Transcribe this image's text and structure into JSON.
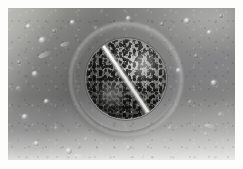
{
  "image": {
    "kind": "micrograph",
    "modality": "phase-contrast / electron micrograph",
    "subject": "dividing coccoid bacterial cell",
    "alt_text": "Grayscale micrograph of a round bacterial cell undergoing binary fission, showing a bright diagonal septum dividing the granular cytoplasm into two daughter cells, surrounded by a bright halo on a mottled gray background",
    "caption": "",
    "orientation": "landscape",
    "border": {
      "style": "white photographic border",
      "color": "#fdfdfc",
      "thickness_px": 8
    },
    "frame": {
      "width_px": 243,
      "height_px": 169
    },
    "plate": {
      "width_px": 227,
      "height_px": 152
    }
  },
  "palette": {
    "border_white": "#fdfdfc",
    "background_light": "#b4b4b2",
    "background_mid": "#8a8a87",
    "background_dark": "#565654",
    "halo_bright": "#f8f8f4",
    "cell_wall": "#ededE8",
    "cytoplasm_dark": "#3c3c3a",
    "granule_black": "#121211",
    "septum_white": "#fafaf6"
  },
  "cell": {
    "label": "dividing bacterial cell",
    "shape": "coccus",
    "center_px": {
      "x": 118,
      "y": 71
    },
    "diameter_px": 96,
    "features": [
      {
        "name": "outer-halo",
        "label": "phase-contrast halo"
      },
      {
        "name": "cell-wall",
        "label": "bright cell wall ring"
      },
      {
        "name": "cell-membrane",
        "label": "inner envelope"
      },
      {
        "name": "cytoplasm",
        "label": "granular cytoplasm"
      },
      {
        "name": "septum",
        "label": "division septum"
      },
      {
        "name": "nucleoid-upper",
        "label": "upper daughter nucleoid"
      },
      {
        "name": "nucleoid-lower",
        "label": "lower daughter nucleoid"
      }
    ],
    "septum": {
      "label": "division septum",
      "orientation": "diagonal, upper-left to lower-right",
      "angle_deg": 56
    },
    "daughter_cells": [
      {
        "name": "daughter-cell-upper-right",
        "label": "upper-right daughter cell"
      },
      {
        "name": "daughter-cell-lower-left",
        "label": "lower-left daughter cell"
      }
    ]
  },
  "background": {
    "label": "substrate field",
    "texture": "mottled film grain with uneven illumination",
    "particles": [
      {
        "id": 1,
        "x": 18,
        "y": 16,
        "size": 5,
        "tone": "bright"
      },
      {
        "id": 2,
        "x": 31,
        "y": 29,
        "size": 7,
        "tone": "bright"
      },
      {
        "id": 3,
        "x": 44,
        "y": 21,
        "size": 4,
        "tone": "dark"
      },
      {
        "id": 4,
        "x": 62,
        "y": 12,
        "size": 5,
        "tone": "bright"
      },
      {
        "id": 5,
        "x": 86,
        "y": 18,
        "size": 4,
        "tone": "faint"
      },
      {
        "id": 6,
        "x": 118,
        "y": 8,
        "size": 5,
        "tone": "bright"
      },
      {
        "id": 7,
        "x": 152,
        "y": 14,
        "size": 4,
        "tone": "dark"
      },
      {
        "id": 8,
        "x": 176,
        "y": 10,
        "size": 6,
        "tone": "bright"
      },
      {
        "id": 9,
        "x": 199,
        "y": 22,
        "size": 5,
        "tone": "bright"
      },
      {
        "id": 10,
        "x": 211,
        "y": 6,
        "size": 4,
        "tone": "dark"
      },
      {
        "id": 11,
        "x": 9,
        "y": 52,
        "size": 4,
        "tone": "dark"
      },
      {
        "id": 12,
        "x": 24,
        "y": 63,
        "size": 6,
        "tone": "bright"
      },
      {
        "id": 13,
        "x": 8,
        "y": 78,
        "size": 5,
        "tone": "faint"
      },
      {
        "id": 14,
        "x": 36,
        "y": 91,
        "size": 5,
        "tone": "bright"
      },
      {
        "id": 15,
        "x": 14,
        "y": 106,
        "size": 6,
        "tone": "bright"
      },
      {
        "id": 16,
        "x": 46,
        "y": 118,
        "size": 4,
        "tone": "faint"
      },
      {
        "id": 17,
        "x": 26,
        "y": 133,
        "size": 5,
        "tone": "bright"
      },
      {
        "id": 18,
        "x": 58,
        "y": 140,
        "size": 6,
        "tone": "bright"
      },
      {
        "id": 19,
        "x": 76,
        "y": 129,
        "size": 4,
        "tone": "faint"
      },
      {
        "id": 20,
        "x": 118,
        "y": 137,
        "size": 5,
        "tone": "faint"
      },
      {
        "id": 21,
        "x": 168,
        "y": 60,
        "size": 5,
        "tone": "bright"
      },
      {
        "id": 22,
        "x": 186,
        "y": 46,
        "size": 4,
        "tone": "dark"
      },
      {
        "id": 23,
        "x": 203,
        "y": 72,
        "size": 6,
        "tone": "bright"
      },
      {
        "id": 24,
        "x": 180,
        "y": 92,
        "size": 4,
        "tone": "faint"
      },
      {
        "id": 25,
        "x": 210,
        "y": 104,
        "size": 5,
        "tone": "faint"
      },
      {
        "id": 26,
        "x": 196,
        "y": 124,
        "size": 4,
        "tone": "faint"
      },
      {
        "id": 27,
        "x": 160,
        "y": 118,
        "size": 4,
        "tone": "faint"
      },
      {
        "id": 28,
        "x": 132,
        "y": 146,
        "size": 4,
        "tone": "faint"
      }
    ],
    "streaks": [
      {
        "id": 1,
        "x": 30,
        "y": 44,
        "w": 14,
        "h": 5,
        "angle": -24
      },
      {
        "id": 2,
        "x": 52,
        "y": 34,
        "w": 11,
        "h": 4,
        "angle": -18
      },
      {
        "id": 3,
        "x": 196,
        "y": 116,
        "w": 13,
        "h": 4,
        "angle": 12
      },
      {
        "id": 4,
        "x": 66,
        "y": 146,
        "w": 12,
        "h": 4,
        "angle": 8
      }
    ]
  }
}
